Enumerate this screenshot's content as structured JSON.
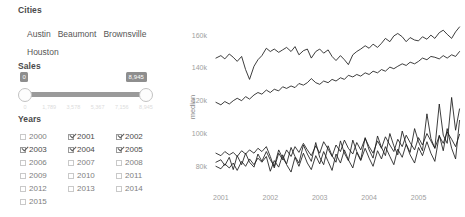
{
  "cities": {
    "title": "Cities",
    "items": [
      {
        "label": "Austin"
      },
      {
        "label": "Beaumont"
      },
      {
        "label": "Brownsville"
      },
      {
        "label": "Houston"
      }
    ]
  },
  "sales": {
    "title": "Sales",
    "min_value": "0",
    "max_value": "8,945",
    "ticks": [
      {
        "label": "0",
        "pos": 0
      },
      {
        "label": "1,789",
        "pos": 20
      },
      {
        "label": "3,578",
        "pos": 40
      },
      {
        "label": "5,367",
        "pos": 60
      },
      {
        "label": "7,156",
        "pos": 80
      },
      {
        "label": "8,945",
        "pos": 100
      }
    ]
  },
  "years": {
    "title": "Years",
    "items": [
      {
        "label": "2000",
        "checked": false
      },
      {
        "label": "2001",
        "checked": true
      },
      {
        "label": "2002",
        "checked": true
      },
      {
        "label": "2003",
        "checked": true
      },
      {
        "label": "2004",
        "checked": true
      },
      {
        "label": "2005",
        "checked": true
      },
      {
        "label": "2006",
        "checked": false
      },
      {
        "label": "2007",
        "checked": false
      },
      {
        "label": "2008",
        "checked": false
      },
      {
        "label": "2009",
        "checked": false
      },
      {
        "label": "2010",
        "checked": false
      },
      {
        "label": "2011",
        "checked": false
      },
      {
        "label": "2012",
        "checked": false
      },
      {
        "label": "2013",
        "checked": false
      },
      {
        "label": "2014",
        "checked": false
      },
      {
        "label": "2015",
        "checked": false
      }
    ]
  },
  "chart_data": {
    "type": "line",
    "title": "",
    "xlabel": "",
    "ylabel": "median",
    "grid": false,
    "legend": "none",
    "xlim": [
      2000.8,
      2005.9
    ],
    "ylim": [
      68000,
      168000
    ],
    "xticks": [
      "2001",
      "2002",
      "2003",
      "2004",
      "2005"
    ],
    "xtick_values": [
      2001,
      2002,
      2003,
      2004,
      2005
    ],
    "yticks": [
      "160k",
      "140k",
      "120k",
      "100k",
      "80k"
    ],
    "ytick_values": [
      160000,
      140000,
      120000,
      100000,
      80000
    ],
    "x": [
      2000.9,
      2001.0,
      2001.08,
      2001.17,
      2001.25,
      2001.33,
      2001.42,
      2001.5,
      2001.58,
      2001.67,
      2001.75,
      2001.83,
      2001.92,
      2002.0,
      2002.08,
      2002.17,
      2002.25,
      2002.33,
      2002.42,
      2002.5,
      2002.58,
      2002.67,
      2002.75,
      2002.83,
      2002.92,
      2003.0,
      2003.08,
      2003.17,
      2003.25,
      2003.33,
      2003.42,
      2003.5,
      2003.58,
      2003.67,
      2003.75,
      2003.83,
      2003.92,
      2004.0,
      2004.08,
      2004.17,
      2004.25,
      2004.33,
      2004.42,
      2004.5,
      2004.58,
      2004.67,
      2004.75,
      2004.83,
      2004.92,
      2005.0,
      2005.08,
      2005.17,
      2005.25,
      2005.33,
      2005.42,
      2005.5,
      2005.58,
      2005.67,
      2005.75,
      2005.83
    ],
    "series": [
      {
        "name": "Austin",
        "values": [
          146000,
          147500,
          145500,
          148500,
          146500,
          144000,
          147000,
          139000,
          133000,
          141000,
          145000,
          147500,
          152000,
          150000,
          151500,
          149500,
          151000,
          152500,
          150000,
          153000,
          148000,
          150500,
          151500,
          146000,
          150000,
          151500,
          149000,
          151000,
          147000,
          144500,
          147500,
          145000,
          142000,
          148000,
          150000,
          151500,
          153500,
          152000,
          154500,
          152500,
          155000,
          158000,
          156000,
          159500,
          161000,
          159000,
          156000,
          158500,
          157000,
          156500,
          159000,
          157500,
          160000,
          158000,
          161500,
          163000,
          160500,
          158000,
          162000,
          165000
        ]
      },
      {
        "name": "Houston",
        "values": [
          119000,
          117500,
          119500,
          118000,
          120000,
          121500,
          120000,
          122500,
          121000,
          123500,
          125000,
          124000,
          126500,
          125000,
          127000,
          126000,
          128500,
          127500,
          129000,
          128000,
          130500,
          129500,
          131000,
          133500,
          131000,
          130000,
          132000,
          131000,
          133000,
          132000,
          134000,
          133000,
          135500,
          134500,
          136000,
          135000,
          137000,
          136000,
          138000,
          137000,
          139000,
          138000,
          140500,
          139500,
          141000,
          142500,
          141500,
          143500,
          142500,
          144000,
          146000,
          145000,
          147000,
          146500,
          145500,
          147500,
          146000,
          148000,
          147000,
          150000
        ]
      },
      {
        "name": "Beaumont",
        "values": [
          88000,
          86500,
          89000,
          87000,
          88500,
          86000,
          89500,
          87500,
          90000,
          88000,
          91000,
          89000,
          92000,
          86000,
          79000,
          88000,
          84000,
          90000,
          86000,
          92000,
          88500,
          94000,
          90000,
          86500,
          92500,
          88000,
          95000,
          90500,
          86000,
          93000,
          89000,
          96000,
          91000,
          87500,
          94500,
          90000,
          97000,
          92000,
          88000,
          95500,
          91000,
          98000,
          93000,
          89000,
          96500,
          92000,
          99000,
          94500,
          90000,
          97500,
          93000,
          100000,
          95500,
          91000,
          98500,
          94000,
          101000,
          96500,
          92000,
          99500
        ]
      },
      {
        "name": "Brownsville",
        "values": [
          80000,
          78500,
          81500,
          79000,
          82000,
          77500,
          83000,
          80000,
          84500,
          81000,
          85000,
          82500,
          86000,
          77000,
          83500,
          79500,
          87000,
          81000,
          76500,
          85500,
          80000,
          88000,
          82000,
          78000,
          86500,
          81500,
          89000,
          83000,
          77500,
          87500,
          82000,
          90000,
          84000,
          79000,
          88500,
          83500,
          91000,
          85000,
          80000,
          89500,
          84500,
          92000,
          86000,
          81000,
          90500,
          85500,
          93500,
          87000,
          82000,
          91500,
          86500,
          95000,
          88000,
          83000,
          99000,
          89500,
          103000,
          91000,
          84500,
          108000
        ]
      },
      {
        "name": "Brownsville-alt",
        "values": [
          82500,
          84000,
          80500,
          85500,
          78000,
          86500,
          81000,
          88000,
          82500,
          79500,
          87500,
          83000,
          89000,
          84000,
          80000,
          90000,
          85000,
          81500,
          91500,
          86000,
          82000,
          93000,
          87500,
          83000,
          94500,
          85500,
          81000,
          92500,
          86500,
          82500,
          95500,
          88000,
          83500,
          96000,
          89000,
          84000,
          97500,
          90000,
          85000,
          98500,
          91500,
          86500,
          100000,
          92500,
          87000,
          101500,
          93500,
          88500,
          103000,
          95000,
          89500,
          112000,
          97000,
          91000,
          118000,
          99000,
          94000,
          122000,
          102000,
          115000
        ]
      }
    ]
  }
}
